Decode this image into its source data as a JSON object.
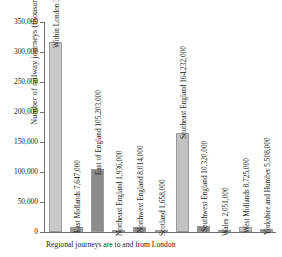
{
  "chart_data": {
    "type": "bar",
    "title": "",
    "xlabel": "",
    "ylabel": "Number of railway journeys (thousands)",
    "ylim": [
      0,
      350000
    ],
    "ytick_values": [
      0,
      50000,
      100000,
      150000,
      200000,
      250000,
      300000,
      350000
    ],
    "ytick_labels": [
      "0",
      "50,000",
      "100,000",
      "150,000",
      "200,000",
      "250,000",
      "300,000",
      "350,000"
    ],
    "grid": false,
    "legend": "none",
    "note": "Regional journeys are to and from London",
    "categories": [
      "Within London",
      "East Midlands",
      "East of England",
      "Northeast England",
      "Northwest England",
      "Scotland",
      "Southeast England",
      "Southwest England",
      "Wales",
      "West Midlands",
      "Yorkshire and Humber"
    ],
    "values": [
      316935,
      7647,
      105203,
      1936,
      8014,
      1658,
      164232,
      10320,
      2051,
      8725,
      5508
    ],
    "bar_labels": [
      "Within London 316,935,000",
      "East Midlands 7,647,000",
      "East of England 105,203,000",
      "Northeast England 1,936,000",
      "Northwest England 8,014,000",
      "Scotland 1,658,000",
      "Southeast England 164,232,000",
      "Southwest England 10,320,000",
      "Wales 2,051,000",
      "West Midlands 8,725,000",
      "Yorkshire and Humber 5,508,000"
    ],
    "bar_colors": [
      "#c9c9c9",
      "#9c9c9c",
      "#8c8c8c",
      "#9c9c9c",
      "#8c8c8c",
      "#9c9c9c",
      "#c2c2c2",
      "#8c8c8c",
      "#bdbdbd",
      "#c9c9c9",
      "#8c8c8c"
    ]
  },
  "axis": {
    "y_title": "Number of railway journeys (thousands)",
    "ticks": [
      "350,000",
      "300,000",
      "250,000",
      "200,000",
      "150,000",
      "100,000",
      "50,000",
      "0"
    ]
  },
  "footnote": {
    "text": "Regional journeys are to and from London"
  },
  "colors": {
    "axis": "#6d6e70",
    "text": "#231f20",
    "background": "#ffffff"
  }
}
